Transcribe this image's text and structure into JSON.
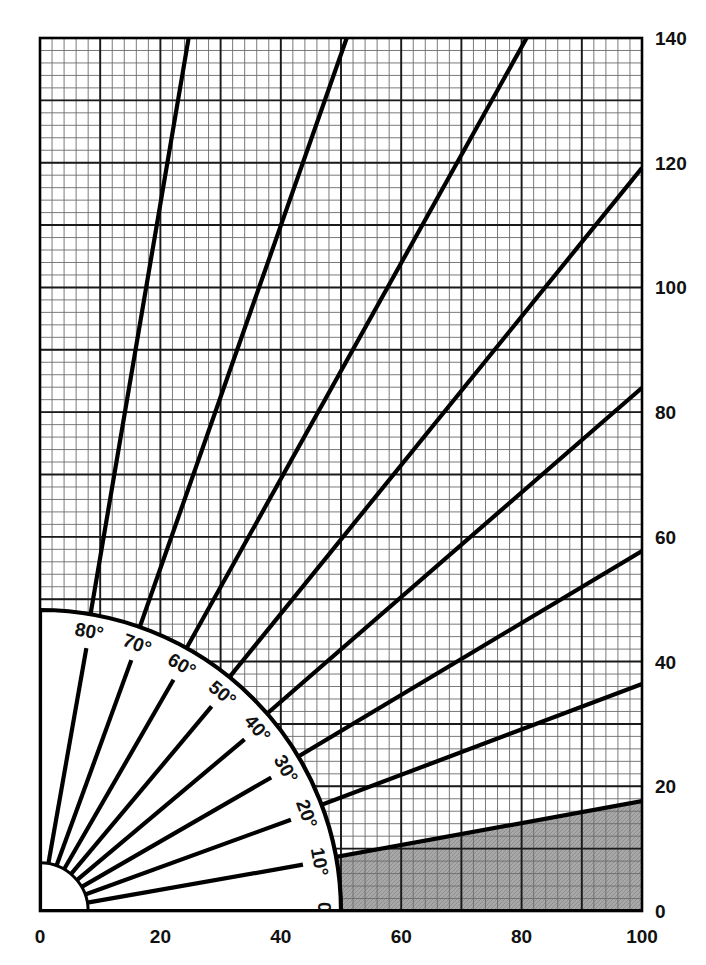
{
  "chart_data": {
    "type": "line",
    "title": "",
    "subtitle": "",
    "xlabel": "",
    "ylabel": "",
    "xlim": [
      0,
      100
    ],
    "ylim": [
      0,
      140
    ],
    "grid": true,
    "grid_minor_step": 2,
    "grid_major_step": 10,
    "legend_position": "none",
    "x_ticks": [
      0,
      20,
      40,
      60,
      80,
      100
    ],
    "x_tick_labels": [
      "0",
      "20",
      "40",
      "60",
      "80",
      "100"
    ],
    "y_ticks": [
      0,
      20,
      40,
      60,
      80,
      100,
      120,
      140
    ],
    "y_tick_labels": [
      "0",
      "20",
      "40",
      "60",
      "80",
      "100",
      "120",
      "140"
    ],
    "protractor": {
      "center": [
        0,
        0
      ],
      "inner_radius_units": 8,
      "outer_radius_units": 50,
      "labels": [
        "0°",
        "10°",
        "20°",
        "30°",
        "40°",
        "50°",
        "60°",
        "70°",
        "80°"
      ],
      "label_angles": [
        0,
        10,
        20,
        30,
        40,
        50,
        60,
        70,
        80
      ]
    },
    "series": [
      {
        "name": "0°",
        "angle_deg": 0,
        "slope": 0.0,
        "x": [
          0,
          100
        ],
        "values": [
          0,
          0
        ]
      },
      {
        "name": "10°",
        "angle_deg": 10,
        "slope": 0.17633,
        "x": [
          0,
          100
        ],
        "values": [
          0,
          17.63
        ]
      },
      {
        "name": "20°",
        "angle_deg": 20,
        "slope": 0.36397,
        "x": [
          0,
          100
        ],
        "values": [
          0,
          36.4
        ]
      },
      {
        "name": "30°",
        "angle_deg": 30,
        "slope": 0.57735,
        "x": [
          0,
          100
        ],
        "values": [
          0,
          57.74
        ]
      },
      {
        "name": "40°",
        "angle_deg": 40,
        "slope": 0.8391,
        "x": [
          0,
          100
        ],
        "values": [
          0,
          83.91
        ]
      },
      {
        "name": "50°",
        "angle_deg": 50,
        "slope": 1.19175,
        "x": [
          0,
          100
        ],
        "values": [
          0,
          119.18
        ]
      },
      {
        "name": "60°",
        "angle_deg": 60,
        "slope": 1.73205,
        "x": [
          0,
          80.83
        ],
        "values": [
          0,
          140
        ]
      },
      {
        "name": "70°",
        "angle_deg": 70,
        "slope": 2.74748,
        "x": [
          0,
          50.95
        ],
        "values": [
          0,
          140
        ]
      },
      {
        "name": "80°",
        "angle_deg": 80,
        "slope": 5.67128,
        "x": [
          0,
          24.69
        ],
        "values": [
          0,
          140
        ]
      }
    ],
    "shaded_region": {
      "label": "below 10°",
      "color": "#a8a8a8",
      "upper_boundary_series": "10°",
      "lower_boundary_series": "0°"
    },
    "colors": {
      "background": "#ffffff",
      "grid_minor": "#6b6b6b",
      "grid_major": "#1a1a1a",
      "axis": "#000000",
      "ray": "#000000",
      "shade": "#a8a8a8",
      "protractor_face": "#ffffff",
      "text": "#111111"
    }
  }
}
